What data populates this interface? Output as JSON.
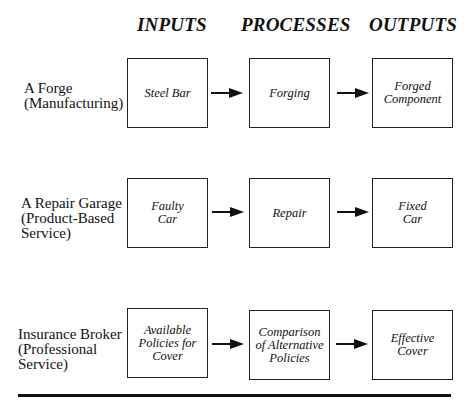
{
  "headers": {
    "inputs": "INPUTS",
    "processes": "PROCESSES",
    "outputs": "OUTPUTS"
  },
  "rows": [
    {
      "label": "A Forge\n(Manufacturing)",
      "input": "Steel Bar",
      "process": "Forging",
      "output": "Forged\nComponent"
    },
    {
      "label": "A Repair Garage\n(Product-Based\nService)",
      "input": "Faulty\nCar",
      "process": "Repair",
      "output": "Fixed\nCar"
    },
    {
      "label": "Insurance Broker\n(Professional\nService)",
      "input": "Available\nPolicies for\nCover",
      "process": "Comparison\nof Alternative\nPolicies",
      "output": "Effective\nCover"
    }
  ]
}
